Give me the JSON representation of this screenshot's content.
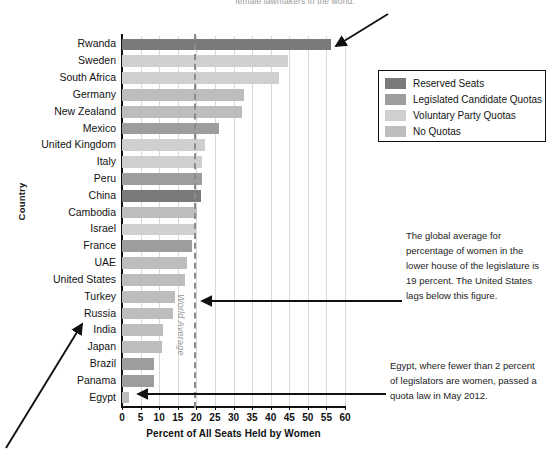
{
  "top_caption": "female lawmakers in the world.",
  "axis": {
    "ylabel": "Country",
    "xlabel": "Percent of All Seats Held by Women",
    "xticks": [
      "0",
      "5",
      "10",
      "15",
      "20",
      "25",
      "30",
      "35",
      "40",
      "45",
      "50",
      "55",
      "60"
    ]
  },
  "world_average": {
    "label": "World Average",
    "value": 19.5
  },
  "legend": {
    "items": [
      {
        "label": "Reserved Seats",
        "color": "#7a7a7a"
      },
      {
        "label": "Legislated Candidate Quotas",
        "color": "#9d9d9d"
      },
      {
        "label": "Voluntary Party Quotas",
        "color": "#cfcfcf"
      },
      {
        "label": "No Quotas",
        "color": "#bdbdbd"
      }
    ]
  },
  "annotations": [
    {
      "id": "world-average-note",
      "text": "The global average for percentage of women in the lower house of the legislature is 19 percent. The United States lags below this figure."
    },
    {
      "id": "egypt-note",
      "text": "Egypt, where fewer than 2 percent of legislators are women, passed a quota law in May 2012."
    }
  ],
  "chart_data": {
    "type": "bar",
    "orientation": "horizontal",
    "title": "",
    "xlabel": "Percent of All Seats Held by Women",
    "ylabel": "Country",
    "xlim": [
      0,
      60
    ],
    "grid": true,
    "legend_position": "top-right",
    "categories": [
      "Rwanda",
      "Sweden",
      "South Africa",
      "Germany",
      "New Zealand",
      "Mexico",
      "United Kingdom",
      "Italy",
      "Peru",
      "China",
      "Cambodia",
      "Israel",
      "France",
      "UAE",
      "United States",
      "Turkey",
      "Russia",
      "India",
      "Japan",
      "Brazil",
      "Panama",
      "Egypt"
    ],
    "values": [
      56.3,
      44.7,
      42.3,
      32.9,
      32.2,
      26.2,
      22.3,
      21.6,
      21.5,
      21.3,
      20.3,
      20.0,
      18.9,
      17.5,
      17.0,
      14.2,
      13.6,
      11.0,
      10.8,
      8.6,
      8.5,
      2.0
    ],
    "series_key": [
      "Reserved Seats",
      "Voluntary Party Quotas",
      "Voluntary Party Quotas",
      "No Quotas",
      "No Quotas",
      "Legislated Candidate Quotas",
      "Voluntary Party Quotas",
      "Voluntary Party Quotas",
      "Legislated Candidate Quotas",
      "Reserved Seats",
      "No Quotas",
      "Voluntary Party Quotas",
      "Legislated Candidate Quotas",
      "No Quotas",
      "No Quotas",
      "No Quotas",
      "No Quotas",
      "No Quotas",
      "No Quotas",
      "Legislated Candidate Quotas",
      "Legislated Candidate Quotas",
      "No Quotas"
    ],
    "annotation_lines": [
      {
        "label": "World Average",
        "value": 19.5,
        "style": "dashed"
      }
    ]
  }
}
